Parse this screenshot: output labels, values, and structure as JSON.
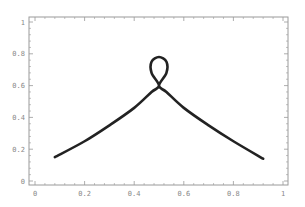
{
  "chart_data": {
    "type": "line",
    "title": "",
    "xlabel": "",
    "ylabel": "",
    "xlim": [
      0,
      1
    ],
    "ylim": [
      0,
      1
    ],
    "grid": false,
    "legend": null,
    "x_ticks": [
      "0",
      "0.2",
      "0.4",
      "0.6",
      "0.8",
      "1"
    ],
    "y_ticks": [
      "0",
      "0.2",
      "0.4",
      "0.6",
      "0.8",
      "1"
    ],
    "series": [
      {
        "name": "parametric curve with loop",
        "color": "#222222",
        "points": [
          [
            0.08,
            0.15
          ],
          [
            0.2,
            0.25
          ],
          [
            0.3,
            0.35
          ],
          [
            0.4,
            0.46
          ],
          [
            0.47,
            0.56
          ],
          [
            0.5,
            0.6
          ],
          [
            0.47,
            0.68
          ],
          [
            0.47,
            0.75
          ],
          [
            0.5,
            0.78
          ],
          [
            0.53,
            0.75
          ],
          [
            0.53,
            0.68
          ],
          [
            0.5,
            0.6
          ],
          [
            0.53,
            0.56
          ],
          [
            0.6,
            0.46
          ],
          [
            0.7,
            0.35
          ],
          [
            0.8,
            0.25
          ],
          [
            0.92,
            0.14
          ]
        ]
      }
    ],
    "annotations": []
  },
  "colors": {
    "axis": "#999999",
    "curve": "#222222"
  }
}
